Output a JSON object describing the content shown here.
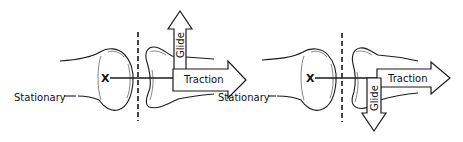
{
  "figure": {
    "panels": [
      {
        "id": "left",
        "labels": {
          "stationary": "Stationary",
          "traction": "Traction",
          "glide": "Glide",
          "axis_marker": "X"
        },
        "glide_direction": "up"
      },
      {
        "id": "right",
        "labels": {
          "stationary": "Stationary",
          "traction": "Traction",
          "glide": "Glide",
          "axis_marker": "X"
        },
        "glide_direction": "down"
      }
    ],
    "colors": {
      "line": "#1a1a1a",
      "background": "#ffffff"
    }
  }
}
